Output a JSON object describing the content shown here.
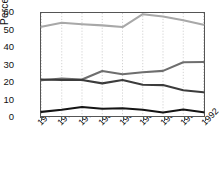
{
  "chart_data": {
    "type": "line",
    "title": "",
    "xlabel": "",
    "ylabel": "Percent",
    "categories": [
      "1975",
      "1977",
      "1979",
      "1980",
      "1981",
      "1983",
      "1988",
      "1990",
      "1992"
    ],
    "ylim": [
      0,
      60
    ],
    "yticks": [
      0,
      10,
      20,
      30,
      40,
      50,
      60
    ],
    "grid": "vertical-dotted",
    "legend": "none",
    "series": [
      {
        "name": "series-light-gray",
        "color": "#a8a8a8",
        "values": [
          52.0,
          54.3,
          53.5,
          52.8,
          51.8,
          59.3,
          58.0,
          55.8,
          53.2
        ]
      },
      {
        "name": "series-medium-gray",
        "color": "#6e6e6e",
        "values": [
          20.8,
          21.8,
          21.3,
          26.2,
          24.3,
          25.5,
          26.3,
          31.3,
          31.5
        ]
      },
      {
        "name": "series-dark-gray",
        "color": "#3c3c3c",
        "values": [
          21.3,
          21.0,
          21.0,
          19.0,
          21.0,
          18.2,
          18.0,
          15.0,
          13.8
        ]
      },
      {
        "name": "series-black",
        "color": "#141414",
        "values": [
          2.4,
          3.6,
          5.2,
          4.2,
          4.5,
          3.6,
          2.0,
          3.8,
          2.2
        ]
      }
    ]
  },
  "axes": {
    "y_title": "Percent",
    "y_tick_labels": [
      "0",
      "10",
      "20",
      "30",
      "40",
      "50",
      "60"
    ],
    "x_tick_labels": [
      "1975",
      "1977",
      "1979",
      "1980",
      "1981",
      "1983",
      "1988",
      "1990",
      "1992"
    ]
  }
}
